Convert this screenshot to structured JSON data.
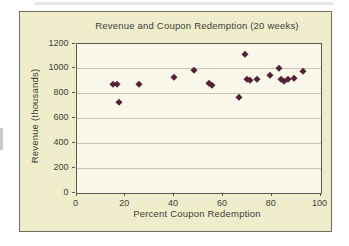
{
  "page": {
    "background": "#ffffff"
  },
  "chart": {
    "frame_border_color": "#6f6f61",
    "chart_background": "#efedcc",
    "plot_background": "#f9f6ea",
    "gridline_color": "#c9c7b2",
    "axis_color": "#59594e",
    "text_color": "#3e3e39",
    "marker_color": "#552139"
  },
  "chart_data": {
    "type": "scatter",
    "title": "Revenue and Coupon Redemption (20 weeks)",
    "xlabel": "Percent Coupon Redemption",
    "ylabel": "Revenue (thousands)",
    "xlim": [
      0,
      100
    ],
    "ylim": [
      0,
      1200
    ],
    "x_ticks": [
      0,
      20,
      40,
      60,
      80,
      100
    ],
    "y_ticks": [
      0,
      200,
      400,
      600,
      800,
      1000,
      1200
    ],
    "grid": "horizontal",
    "legend": "none",
    "points": [
      [
        15,
        875
      ],
      [
        16.5,
        875
      ],
      [
        17.5,
        730
      ],
      [
        25.5,
        873
      ],
      [
        40,
        930
      ],
      [
        48,
        985
      ],
      [
        54.5,
        885
      ],
      [
        55.5,
        863
      ],
      [
        66.5,
        772
      ],
      [
        69,
        1114
      ],
      [
        70,
        918
      ],
      [
        71,
        903
      ],
      [
        74,
        915
      ],
      [
        79.5,
        947
      ],
      [
        83,
        1003
      ],
      [
        84,
        913
      ],
      [
        85,
        900
      ],
      [
        86.5,
        913
      ],
      [
        89,
        922
      ],
      [
        93,
        975
      ]
    ]
  }
}
